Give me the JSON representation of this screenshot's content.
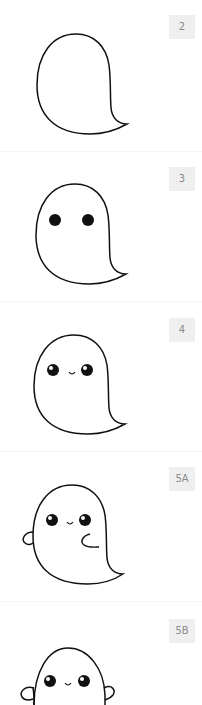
{
  "steps": [
    {
      "label": "2",
      "description": "ghost outline"
    },
    {
      "label": "3",
      "description": "ghost outline with eyes"
    },
    {
      "label": "4",
      "description": "ghost with shiny eyes and smile"
    },
    {
      "label": "5A",
      "description": "ghost with one arm raised and one arm folded"
    },
    {
      "label": "5B",
      "description": "ghost with both arms raised"
    }
  ],
  "colors": {
    "stroke": "#111111",
    "label_bg": "#efefef",
    "label_text": "#8a8a8a",
    "background": "#ffffff"
  }
}
